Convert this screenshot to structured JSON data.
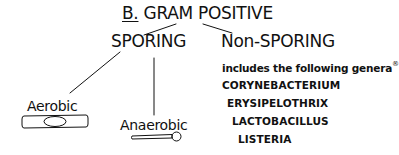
{
  "diagram": {
    "title": {
      "prefix": "B.",
      "text": "GRAM POSITIVE"
    },
    "branches": {
      "sporing": {
        "label": "SPORING",
        "children": {
          "aerobic": {
            "label": "Aerobic",
            "shape": "rod-with-central-oval-spore"
          },
          "anaerobic": {
            "label": "Anaerobic",
            "shape": "rod-with-terminal-round-spore"
          }
        }
      },
      "non_sporing": {
        "label": "Non-SPORING",
        "note": "includes the following genera",
        "note_marker": "®",
        "genera": [
          "CORYNEBACTERIUM",
          "ERYSIPELOTHRIX",
          "LACTOBACILLUS",
          "LISTERIA"
        ]
      }
    },
    "colors": {
      "ink": "#111111",
      "background": "#ffffff"
    }
  }
}
